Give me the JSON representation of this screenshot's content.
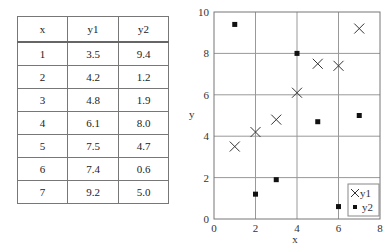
{
  "table": {
    "headers": [
      "x",
      "y1",
      "y2"
    ],
    "rows": [
      [
        "1",
        "3.5",
        "9.4"
      ],
      [
        "2",
        "4.2",
        "1.2"
      ],
      [
        "3",
        "4.8",
        "1.9"
      ],
      [
        "4",
        "6.1",
        "8.0"
      ],
      [
        "5",
        "7.5",
        "4.7"
      ],
      [
        "6",
        "7.4",
        "0.6"
      ],
      [
        "7",
        "9.2",
        "5.0"
      ]
    ]
  },
  "chart_data": {
    "type": "scatter",
    "title": "",
    "xlabel": "x",
    "ylabel": "y",
    "xlim": [
      0,
      8
    ],
    "ylim": [
      0,
      10
    ],
    "xticks": [
      "0",
      "2",
      "4",
      "6",
      "8"
    ],
    "yticks": [
      "0",
      "2",
      "4",
      "6",
      "8",
      "10"
    ],
    "grid": true,
    "legend_position": "lower right",
    "x": [
      1,
      2,
      3,
      4,
      5,
      6,
      7
    ],
    "series": [
      {
        "name": "y1",
        "marker": "x",
        "values": [
          3.5,
          4.2,
          4.8,
          6.1,
          7.5,
          7.4,
          9.2
        ]
      },
      {
        "name": "y2",
        "marker": "square",
        "values": [
          9.4,
          1.2,
          1.9,
          8.0,
          4.7,
          0.6,
          5.0
        ]
      }
    ]
  },
  "colors": {
    "marker": "#111111",
    "grid": "#999999",
    "frame": "#777777"
  }
}
